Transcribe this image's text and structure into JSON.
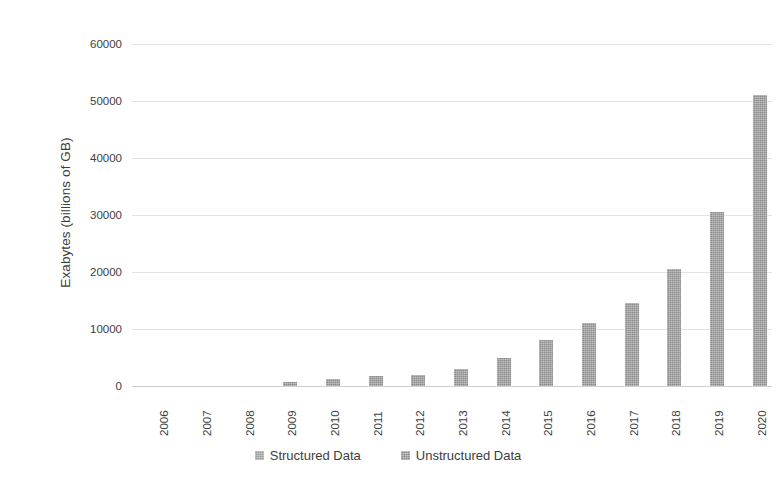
{
  "chart_data": {
    "type": "bar",
    "title": "",
    "subtitle": "",
    "xlabel": "",
    "ylabel": "Exabytes (billions of GB)",
    "categories": [
      "2006",
      "2007",
      "2008",
      "2009",
      "2010",
      "2011",
      "2012",
      "2013",
      "2014",
      "2015",
      "2016",
      "2017",
      "2018",
      "2019",
      "2020"
    ],
    "series": [
      {
        "name": "Structured Data",
        "color": "#9a9a9a",
        "values": [
          0,
          0,
          0,
          0,
          0,
          0,
          0,
          0,
          0,
          0,
          0,
          0,
          0,
          0,
          0
        ]
      },
      {
        "name": "Unstructured Data",
        "color": "#8c8c8c",
        "values": [
          0,
          0,
          0,
          700,
          1200,
          1800,
          1900,
          2900,
          4900,
          8000,
          11100,
          14500,
          20500,
          30500,
          51000
        ]
      }
    ],
    "ylim": [
      0,
      60000
    ],
    "ytick_values": [
      0,
      10000,
      20000,
      30000,
      40000,
      50000,
      60000
    ],
    "ytick_labels": [
      "0",
      "10000",
      "20000",
      "30000",
      "40000",
      "50000",
      "60000"
    ],
    "grid": true,
    "legend_position": "bottom",
    "x_tick_rotation": -90
  },
  "legend": {
    "items": [
      {
        "label": "Structured Data",
        "swatch": "legend-swatch-structured"
      },
      {
        "label": "Unstructured Data",
        "swatch": "legend-swatch-unstructured"
      }
    ]
  },
  "axes": {
    "y_title": "Exabytes (billions of GB)"
  }
}
